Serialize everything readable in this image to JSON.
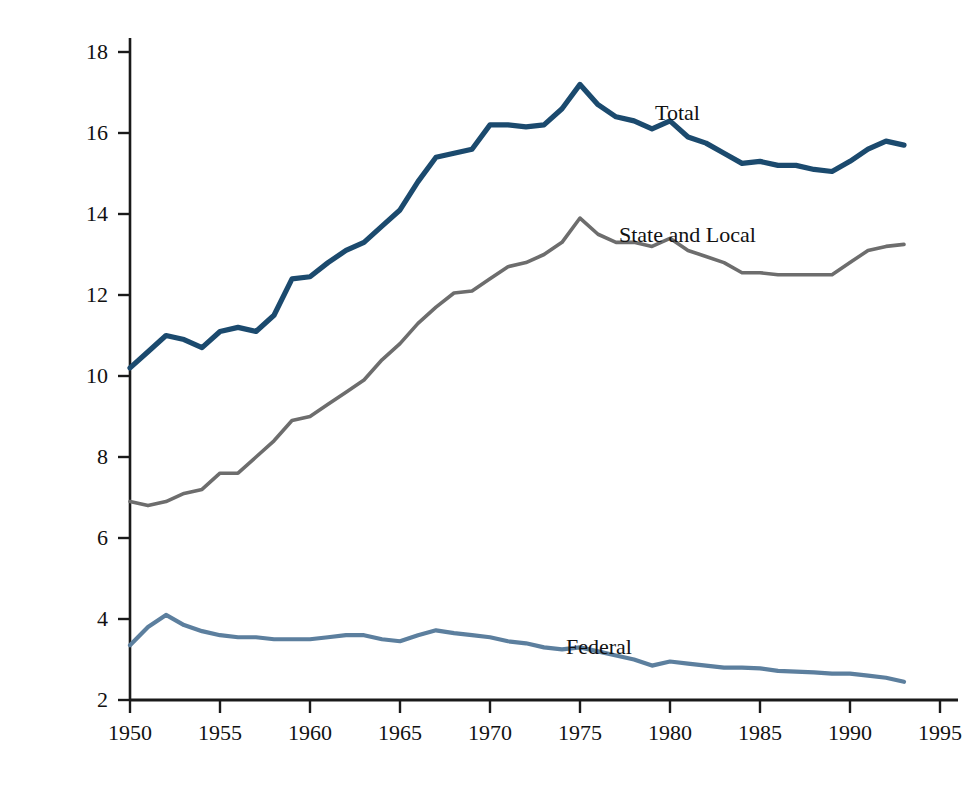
{
  "chart_data": {
    "type": "line",
    "title": "",
    "xlabel": "",
    "ylabel": "Percentage of Workforce",
    "xlim": [
      1950,
      1995
    ],
    "ylim": [
      2,
      18
    ],
    "xticks": [
      1950,
      1955,
      1960,
      1965,
      1970,
      1975,
      1980,
      1985,
      1990,
      1995
    ],
    "yticks": [
      2,
      4,
      6,
      8,
      10,
      12,
      14,
      16,
      18
    ],
    "grid": false,
    "legend_position": "inline-annotations",
    "x": [
      1950,
      1951,
      1952,
      1953,
      1954,
      1955,
      1956,
      1957,
      1958,
      1959,
      1960,
      1961,
      1962,
      1963,
      1964,
      1965,
      1966,
      1967,
      1968,
      1969,
      1970,
      1971,
      1972,
      1973,
      1974,
      1975,
      1976,
      1977,
      1978,
      1979,
      1980,
      1981,
      1982,
      1983,
      1984,
      1985,
      1986,
      1987,
      1988,
      1989,
      1990,
      1991,
      1992,
      1993
    ],
    "series": [
      {
        "name": "Total",
        "color": "#1b4a6e",
        "values": [
          10.2,
          10.6,
          11.0,
          10.9,
          10.7,
          11.1,
          11.2,
          11.1,
          11.5,
          12.4,
          12.45,
          12.8,
          13.1,
          13.3,
          13.7,
          14.1,
          14.8,
          15.4,
          15.5,
          15.6,
          16.2,
          16.2,
          16.15,
          16.2,
          16.6,
          17.2,
          16.7,
          16.4,
          16.3,
          16.1,
          16.3,
          15.9,
          15.75,
          15.5,
          15.25,
          15.3,
          15.2,
          15.2,
          15.1,
          15.05,
          15.3,
          15.6,
          15.8,
          15.7
        ]
      },
      {
        "name": "State and Local",
        "color": "#6d6d6d",
        "values": [
          6.9,
          6.8,
          6.9,
          7.1,
          7.2,
          7.6,
          7.6,
          8.0,
          8.4,
          8.9,
          9.0,
          9.3,
          9.6,
          9.9,
          10.4,
          10.8,
          11.3,
          11.7,
          12.05,
          12.1,
          12.4,
          12.7,
          12.8,
          13.0,
          13.3,
          13.9,
          13.5,
          13.3,
          13.3,
          13.2,
          13.4,
          13.1,
          12.95,
          12.8,
          12.55,
          12.55,
          12.5,
          12.5,
          12.5,
          12.5,
          12.8,
          13.1,
          13.2,
          13.25
        ]
      },
      {
        "name": "Federal",
        "color": "#5c7f9e",
        "values": [
          3.35,
          3.8,
          4.1,
          3.85,
          3.7,
          3.6,
          3.55,
          3.55,
          3.5,
          3.5,
          3.5,
          3.55,
          3.6,
          3.6,
          3.5,
          3.45,
          3.6,
          3.72,
          3.65,
          3.6,
          3.55,
          3.45,
          3.4,
          3.3,
          3.25,
          3.3,
          3.2,
          3.1,
          3.0,
          2.85,
          2.95,
          2.9,
          2.85,
          2.8,
          2.8,
          2.78,
          2.72,
          2.7,
          2.68,
          2.65,
          2.65,
          2.6,
          2.55,
          2.45
        ]
      }
    ],
    "annotations": [
      {
        "text": "Total",
        "x_px": 655,
        "y_px": 100
      },
      {
        "text": "State and Local",
        "x_px": 619,
        "y_px": 222
      },
      {
        "text": "Federal",
        "x_px": 566,
        "y_px": 634
      }
    ]
  },
  "axis": {
    "y_title": "Percentage of Workforce",
    "y_tick_labels": [
      "18",
      "16",
      "14",
      "12",
      "10",
      "8",
      "6",
      "4",
      "2"
    ],
    "x_tick_labels": [
      "1950",
      "1955",
      "1960",
      "1965",
      "1970",
      "1975",
      "1980",
      "1985",
      "1990",
      "1995"
    ]
  },
  "colors": {
    "total": "#1b4a6e",
    "state_and_local": "#6d6d6d",
    "federal": "#5c7f9e",
    "axis": "#1a1a1a",
    "background": "#ffffff"
  }
}
